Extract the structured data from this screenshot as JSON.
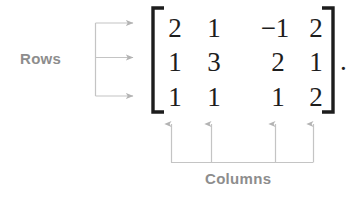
{
  "figure": {
    "background_color": "#ffffff",
    "arrow_color": "#b3b3b3",
    "label_color": "#8d8d8d",
    "matrix_text_color": "#1d1d1d",
    "trailing_punctuation": "."
  },
  "labels": {
    "rows": "Rows",
    "columns": "Columns"
  },
  "matrix": {
    "rows": 3,
    "columns": 4,
    "left_bracket": "[",
    "right_bracket": "]",
    "values": [
      [
        "2",
        "1",
        "−1",
        "2"
      ],
      [
        "1",
        "3",
        "2",
        "1"
      ],
      [
        "1",
        "1",
        "1",
        "2"
      ]
    ]
  },
  "annotations": {
    "row_arrows": [
      {
        "name": "row-arrow-1",
        "target_row": 1
      },
      {
        "name": "row-arrow-2",
        "target_row": 2
      },
      {
        "name": "row-arrow-3",
        "target_row": 3
      }
    ],
    "column_arrows": [
      {
        "name": "column-arrow-1",
        "target_column": 1
      },
      {
        "name": "column-arrow-2",
        "target_column": 2
      },
      {
        "name": "column-arrow-3",
        "target_column": 3
      },
      {
        "name": "column-arrow-4",
        "target_column": 4
      }
    ]
  }
}
